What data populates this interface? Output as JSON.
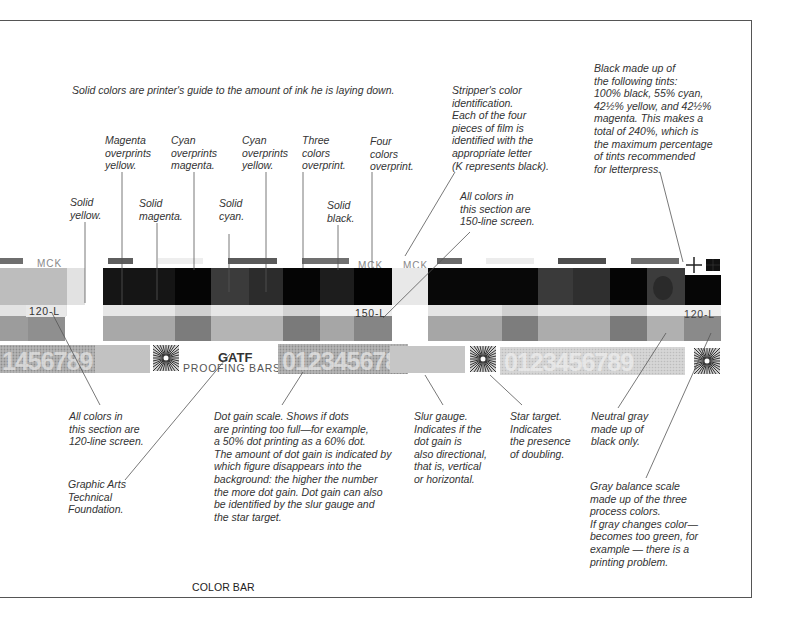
{
  "page": {
    "caption": "COLOR BAR"
  },
  "headline": "Solid colors are printer's guide to the amount of ink he is laying down.",
  "notes": {
    "solid_yellow": "Solid\nyellow.",
    "magenta_over_yellow": "Magenta\noverprints\nyellow.",
    "solid_magenta": "Solid\nmagenta.",
    "cyan_over_magenta": "Cyan\noverprints\nmagenta.",
    "solid_cyan": "Solid\ncyan.",
    "cyan_over_yellow": "Cyan\noverprints\nyellow.",
    "three_colors": "Three\ncolors\noverprint.",
    "solid_black": "Solid\nblack.",
    "four_colors": "Four\ncolors\noverprint.",
    "stripper_id": "Stripper's color\nidentification.\nEach of the four\npieces of film is\nidentified with the\nappropriate letter\n(K represents black).",
    "line150": "All colors in\nthis section are\n150-line screen.",
    "black_tints": "Black made up of\nthe following tints:\n100% black, 55% cyan,\n42½% yellow, and 42½%\nmagenta. This makes a\ntotal of 240%, which is\nthe maximum percentage\nof tints recommended\nfor letterpress.",
    "line120": "All colors in\nthis section are\n120-line screen.",
    "gatf": "Graphic Arts\nTechnical\nFoundation.",
    "dot_gain": "Dot gain scale. Shows if dots\nare printing too full—for example,\na 50% dot printing as a 60% dot.\nThe amount of dot gain is indicated by\nwhich figure disappears into the\nbackground: the higher the number\nthe more dot gain. Dot gain can also\nbe identified by the slur gauge and\nthe star target.",
    "slur_gauge": "Slur gauge.\nIndicates if the\ndot gain is\nalso directional,\nthat is, vertical\nor horizontal.",
    "star_target": "Star target.\nIndicates\nthe presence\nof doubling.",
    "neutral_gray": "Neutral gray\nmade up of\nblack only.",
    "gray_balance": "Gray balance scale\nmade up of the three\nprocess colors.\nIf gray changes color—\nbecomes too green, for\nexample — there is a\nprinting problem."
  },
  "bar": {
    "labels": {
      "mck_left": "MCK",
      "mck_mid1": "MCK",
      "mck_mid2": "MCK",
      "screen_120_left": "120-L",
      "screen_150": "150-L",
      "screen_120_right": "120-L",
      "logo": "GATF",
      "proofing_bars": "PROOFING  BARS",
      "dot_gain_digits_left": "1456789",
      "dot_gain_digits_mid": "0123456789",
      "dot_gain_digits_right": "0123456789",
      "register_mark": "+"
    },
    "colors": {
      "solid_dark": "#111111",
      "black": "#050505",
      "dark_gray": "#2b2b2b",
      "mid_gray": "#555555",
      "tint_light": "#e8e8e8",
      "tint_mid": "#a9a9a9",
      "tint_dark": "#808080",
      "panel_light": "#bdbdbd",
      "scale_bg": "#b8b8b8",
      "scale_digits": "#e6e6e6",
      "line": "#555555"
    }
  }
}
